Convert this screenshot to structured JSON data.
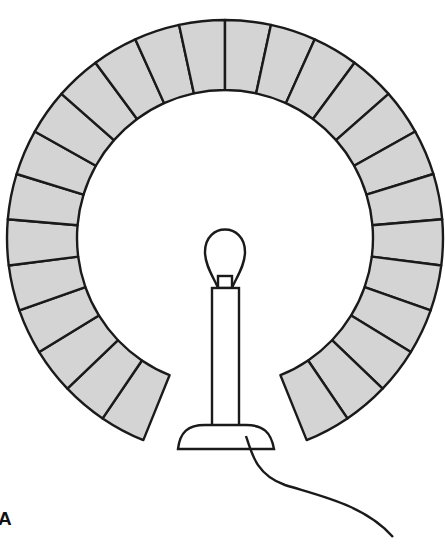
{
  "figure": {
    "label": "A"
  },
  "ring": {
    "center": [
      225,
      238
    ],
    "outer_radius": 218,
    "inner_radius": 148,
    "segment_count": 26,
    "gap_start_deg": 112,
    "gap_end_deg": 68,
    "fill": "#d4d4d4",
    "stroke": "#1a1a1a"
  },
  "lamp": {
    "bulb_color": "#ffffff",
    "stroke": "#1a1a1a"
  }
}
